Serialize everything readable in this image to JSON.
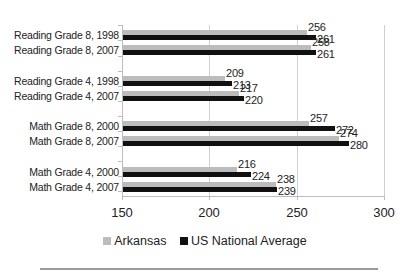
{
  "chart_data": {
    "type": "bar",
    "orientation": "horizontal",
    "title": "",
    "xlabel": "",
    "ylabel": "",
    "xlim": [
      150,
      300
    ],
    "xticks": [
      150,
      200,
      250,
      300
    ],
    "grid": true,
    "legend_position": "bottom",
    "categories": [
      "Reading Grade 8, 1998",
      "Reading Grade 8, 2007",
      "Reading Grade 4, 1998",
      "Reading Grade 4, 2007",
      "Math Grade 8, 2000",
      "Math Grade 8, 2007",
      "Math Grade 4, 2000",
      "Math Grade 4, 2007"
    ],
    "series": [
      {
        "name": "Arkansas",
        "color": "#bcbcbc",
        "values": [
          256,
          258,
          209,
          217,
          257,
          274,
          216,
          238
        ]
      },
      {
        "name": "US National Average",
        "color": "#111111",
        "values": [
          261,
          261,
          213,
          220,
          272,
          280,
          224,
          239
        ]
      }
    ]
  },
  "xaxis": {
    "ticks": [
      "150",
      "200",
      "250",
      "300"
    ]
  },
  "legend": {
    "items": [
      {
        "label": "Arkansas",
        "color": "#bcbcbc"
      },
      {
        "label": "US National Average",
        "color": "#111111"
      }
    ]
  }
}
